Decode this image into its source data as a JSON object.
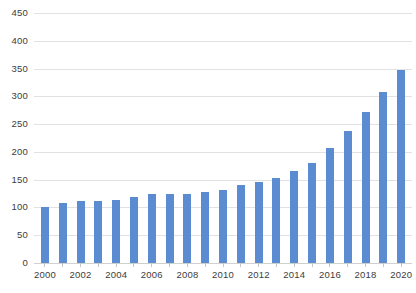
{
  "chart_data": {
    "type": "bar",
    "title": "",
    "subtitle": "",
    "xlabel": "",
    "ylabel": "",
    "categories": [
      "2000",
      "2001",
      "2002",
      "2003",
      "2004",
      "2005",
      "2006",
      "2007",
      "2008",
      "2009",
      "2010",
      "2011",
      "2012",
      "2013",
      "2014",
      "2015",
      "2016",
      "2017",
      "2018",
      "2019",
      "2020"
    ],
    "values": [
      101,
      108,
      111,
      112,
      113,
      119,
      124,
      125,
      124,
      127,
      132,
      140,
      146,
      153,
      166,
      180,
      207,
      238,
      272,
      307,
      348
    ],
    "series": [
      {
        "name": "Series 1",
        "values": [
          101,
          108,
          111,
          112,
          113,
          119,
          124,
          125,
          124,
          127,
          132,
          140,
          146,
          153,
          166,
          180,
          207,
          238,
          272,
          307,
          348
        ]
      }
    ],
    "ylim": [
      0,
      450
    ],
    "ytick_values": [
      0,
      50,
      100,
      150,
      200,
      250,
      300,
      350,
      400,
      450
    ],
    "ytick_labels": [
      "0",
      "50",
      "100",
      "150",
      "200",
      "250",
      "300",
      "350",
      "400",
      "450"
    ],
    "xtick_labels": [
      "2000",
      "2001",
      "2002",
      "2003",
      "2004",
      "2005",
      "2006",
      "2007",
      "2008",
      "2009",
      "2010",
      "2011",
      "2012",
      "2013",
      "2014",
      "2015",
      "2016",
      "2017",
      "2018",
      "2019",
      "2020"
    ],
    "xtick_labels_visible": [
      "2000",
      "",
      "2002",
      "",
      "2004",
      "",
      "2006",
      "",
      "2008",
      "",
      "2010",
      "",
      "2012",
      "",
      "2014",
      "",
      "2016",
      "",
      "2018",
      "",
      "2020"
    ],
    "grid": true,
    "grid_axis": "y",
    "legend": false,
    "legend_position": "none",
    "bar_color": "#5b8bd0",
    "gridline_color": "#e2e2e2",
    "axis_text_color": "#3c3c3c",
    "background_color": "#ffffff",
    "annotations": []
  }
}
